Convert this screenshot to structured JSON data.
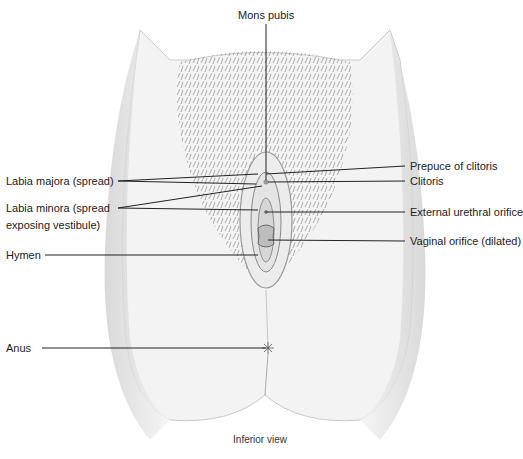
{
  "diagram": {
    "view": "Inferior view",
    "labels": {
      "mons_pubis": "Mons pubis",
      "labia_majora": "Labia majora (spread)",
      "labia_minora_line1": "Labia minora (spread",
      "labia_minora_line2": "exposing vestibule)",
      "hymen": "Hymen",
      "anus": "Anus",
      "prepuce": "Prepuce of clitoris",
      "clitoris": "Clitoris",
      "urethral": "External urethral orifice",
      "vaginal": "Vaginal orifice (dilated)"
    },
    "colors": {
      "skin": "#f2f2f2",
      "shade": "#d9d9d9",
      "hair": "#8a8a8a",
      "line": "#222222"
    }
  }
}
